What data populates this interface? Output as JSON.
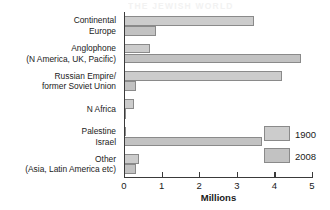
{
  "bleed_text": "THE JEWISH WORLD",
  "chart_data": {
    "type": "bar",
    "orientation": "horizontal",
    "title": "",
    "xlabel": "Millions",
    "ylabel": "",
    "xlim": [
      0,
      5
    ],
    "xticks": [
      0,
      1,
      2,
      3,
      4,
      5
    ],
    "xtick_labels": [
      "0",
      "1",
      "2",
      "3",
      "4",
      "5"
    ],
    "grid": false,
    "legend_position": "right-middle",
    "categories": [
      "Continental\nEurope",
      "Anglophone\n(N America, UK, Pacific)",
      "Russian Empire/\nformer Soviet Union",
      "N Africa",
      "Palestine\nIsrael",
      "Other\n(Asia, Latin America etc)"
    ],
    "category_lines": [
      [
        "Continental",
        "Europe"
      ],
      [
        "Anglophone",
        "(N America, UK, Pacific)"
      ],
      [
        "Russian Empire/",
        "former Soviet Union"
      ],
      [
        "N Africa"
      ],
      [
        "Palestine",
        "Israel"
      ],
      [
        "Other",
        "(Asia, Latin America etc)"
      ]
    ],
    "series": [
      {
        "name": "1900",
        "color": "#cccccc",
        "values": [
          3.45,
          0.7,
          4.2,
          0.27,
          0.02,
          0.4
        ]
      },
      {
        "name": "2008",
        "color": "#c2c2c2",
        "values": [
          0.85,
          4.72,
          0.32,
          0.01,
          3.68,
          0.32
        ]
      }
    ]
  },
  "legend": {
    "items": [
      {
        "label": "1900",
        "color": "#cccccc"
      },
      {
        "label": "2008",
        "color": "#c2c2c2"
      }
    ]
  },
  "axis": {
    "title": "Millions"
  }
}
